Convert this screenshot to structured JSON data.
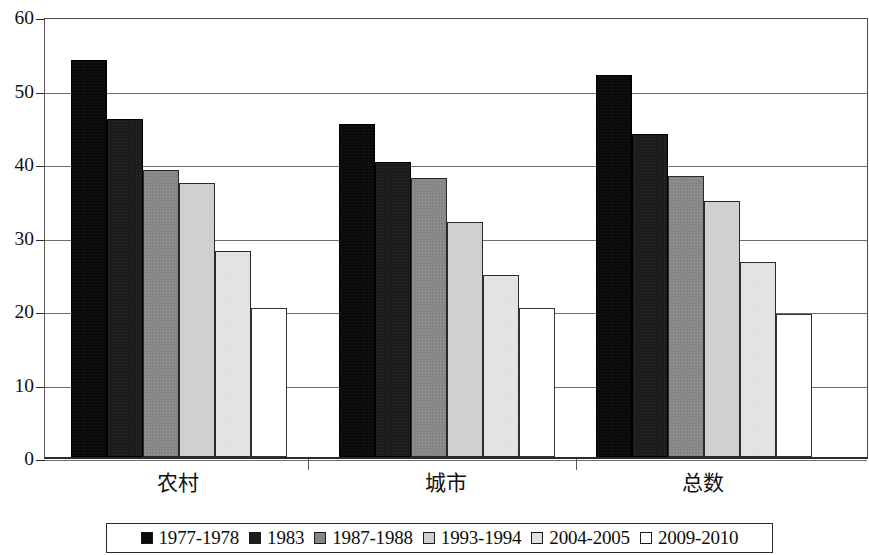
{
  "chart_data": {
    "type": "bar",
    "title": "",
    "xlabel": "",
    "ylabel": "",
    "ylim": [
      0,
      60
    ],
    "yticks": [
      0,
      10,
      20,
      30,
      40,
      50,
      60
    ],
    "grid": true,
    "legend_position": "bottom",
    "categories": [
      "农村",
      "城市",
      "总数"
    ],
    "series": [
      {
        "name": "1977-1978",
        "color": "#0a0a0a",
        "values": [
          54.0,
          45.3,
          52.0
        ]
      },
      {
        "name": "1983",
        "color": "#1c1c1c",
        "values": [
          46.0,
          40.2,
          44.0
        ]
      },
      {
        "name": "1987-1988",
        "color": "#868686",
        "values": [
          39.0,
          38.0,
          38.3
        ]
      },
      {
        "name": "1993-1994",
        "color": "#cfcfcf",
        "values": [
          37.3,
          32.0,
          34.8
        ]
      },
      {
        "name": "2004-2005",
        "color": "#e2e2e2",
        "values": [
          28.0,
          24.8,
          26.5
        ]
      },
      {
        "name": "2009-2010",
        "color": "#ffffff",
        "values": [
          20.3,
          20.3,
          19.5
        ]
      }
    ]
  },
  "axis": {
    "tick_labels": [
      "60",
      "50",
      "40",
      "30",
      "20",
      "10",
      "0"
    ]
  },
  "legend": {
    "items": [
      {
        "label": "1977-1978"
      },
      {
        "label": "1983"
      },
      {
        "label": "1987-1988"
      },
      {
        "label": "1993-1994"
      },
      {
        "label": "2004-2005"
      },
      {
        "label": "2009-2010"
      }
    ]
  }
}
